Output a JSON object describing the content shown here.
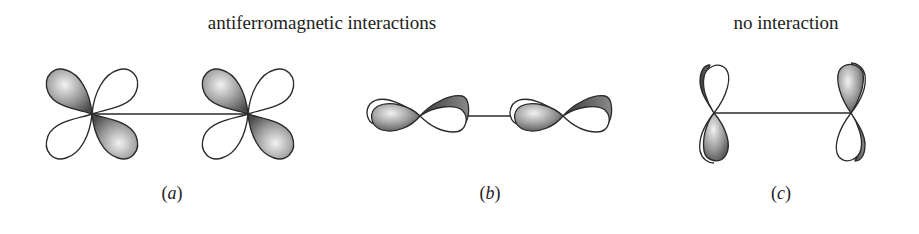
{
  "figure": {
    "headings": [
      {
        "id": "antiferro",
        "text": "antiferromagnetic interactions",
        "center_x": 322
      },
      {
        "id": "none",
        "text": "no interaction",
        "center_x": 786
      }
    ],
    "panels": [
      {
        "id": "a",
        "label": "a",
        "label_x": 172,
        "description": "two d-orbitals (four lobes, alternating shaded) joined by a bond"
      },
      {
        "id": "b",
        "label": "b",
        "label_x": 490,
        "description": "two hybrid p-orbitals lying horizontally, joined by a bond"
      },
      {
        "id": "c",
        "label": "c",
        "label_x": 781,
        "description": "two vertical p-orbitals, orthogonal to bond"
      }
    ],
    "colors": {
      "outline": "#2a2a2a",
      "shade_light": "#e6e6e6",
      "shade_dark": "#5a5a5a",
      "background": "#ffffff"
    }
  }
}
